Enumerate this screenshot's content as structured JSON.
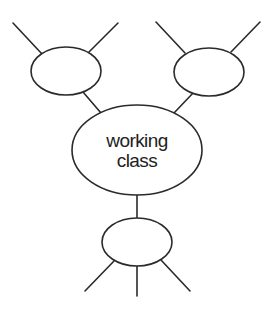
{
  "diagram": {
    "type": "network",
    "style": {
      "stroke_color": "#2a2a2a",
      "background": "#ffffff"
    },
    "nodes": [
      {
        "id": "center",
        "label_lines": [
          "working",
          "class"
        ],
        "cx": 137,
        "cy": 150,
        "rx": 65,
        "ry": 45
      },
      {
        "id": "top-left",
        "label_lines": [],
        "cx": 66,
        "cy": 71,
        "rx": 35,
        "ry": 24
      },
      {
        "id": "top-right",
        "label_lines": [],
        "cx": 209,
        "cy": 72,
        "rx": 35,
        "ry": 24
      },
      {
        "id": "bottom",
        "label_lines": [],
        "cx": 137,
        "cy": 242,
        "rx": 35,
        "ry": 24
      }
    ],
    "center_label": {
      "line1": "working",
      "line2": "class"
    },
    "edges": [
      {
        "from": "top-left",
        "to": "outer",
        "x1": 13,
        "y1": 23,
        "x2": 42,
        "y2": 54
      },
      {
        "from": "top-left",
        "to": "outer",
        "x1": 118,
        "y1": 23,
        "x2": 88,
        "y2": 53
      },
      {
        "from": "top-left",
        "to": "center",
        "x1": 83,
        "y1": 92,
        "x2": 101,
        "y2": 113
      },
      {
        "from": "top-right",
        "to": "outer",
        "x1": 156,
        "y1": 22,
        "x2": 185,
        "y2": 53
      },
      {
        "from": "top-right",
        "to": "outer",
        "x1": 260,
        "y1": 22,
        "x2": 231,
        "y2": 52
      },
      {
        "from": "top-right",
        "to": "center",
        "x1": 194,
        "y1": 92,
        "x2": 174,
        "y2": 113
      },
      {
        "from": "center",
        "to": "bottom",
        "x1": 137,
        "y1": 195,
        "x2": 137,
        "y2": 218
      },
      {
        "from": "bottom",
        "to": "outer",
        "x1": 114,
        "y1": 261,
        "x2": 85,
        "y2": 291
      },
      {
        "from": "bottom",
        "to": "outer",
        "x1": 137,
        "y1": 266,
        "x2": 137,
        "y2": 296
      },
      {
        "from": "bottom",
        "to": "outer",
        "x1": 161,
        "y1": 260,
        "x2": 190,
        "y2": 291
      }
    ]
  }
}
